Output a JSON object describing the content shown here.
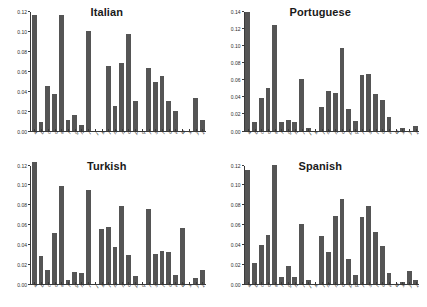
{
  "figure": {
    "layout": "2x2-grid",
    "bar_color": "#555555",
    "axis_color": "#3a3a3a",
    "background": "#ffffff"
  },
  "chart_data": [
    {
      "type": "bar",
      "title": "Italian",
      "xlabel": "",
      "ylabel": "",
      "ylim": [
        0.0,
        0.12
      ],
      "yticks": [
        "0.00",
        "0.02",
        "0.04",
        "0.06",
        "0.08",
        "0.10",
        "0.12"
      ],
      "ytick_values": [
        0.0,
        0.02,
        0.04,
        0.06,
        0.08,
        0.1,
        0.12
      ],
      "grid": false,
      "legend": "none",
      "categories": [
        "a",
        "b",
        "c",
        "d",
        "e",
        "f",
        "g",
        "h",
        "i",
        "j",
        "k",
        "l",
        "m",
        "n",
        "o",
        "p",
        "q",
        "r",
        "s",
        "t",
        "u",
        "v",
        "w",
        "x",
        "y",
        "z"
      ],
      "values": [
        0.117,
        0.009,
        0.045,
        0.037,
        0.117,
        0.011,
        0.016,
        0.006,
        0.101,
        0.0,
        0.0,
        0.065,
        0.025,
        0.068,
        0.098,
        0.03,
        0.0,
        0.063,
        0.049,
        0.055,
        0.03,
        0.02,
        0.0,
        0.0,
        0.033,
        0.011
      ]
    },
    {
      "type": "bar",
      "title": "Portuguese",
      "xlabel": "",
      "ylabel": "",
      "ylim": [
        0.0,
        0.14
      ],
      "yticks": [
        "0.00",
        "0.02",
        "0.04",
        "0.06",
        "0.08",
        "0.10",
        "0.12",
        "0.14"
      ],
      "ytick_values": [
        0.0,
        0.02,
        0.04,
        0.06,
        0.08,
        0.1,
        0.12,
        0.14
      ],
      "grid": false,
      "legend": "none",
      "categories": [
        "a",
        "b",
        "c",
        "d",
        "e",
        "f",
        "g",
        "h",
        "i",
        "j",
        "k",
        "l",
        "m",
        "n",
        "o",
        "p",
        "q",
        "r",
        "s",
        "t",
        "u",
        "v",
        "w",
        "x",
        "y",
        "z"
      ],
      "values": [
        0.14,
        0.01,
        0.039,
        0.05,
        0.125,
        0.01,
        0.012,
        0.01,
        0.061,
        0.003,
        0.0,
        0.028,
        0.047,
        0.044,
        0.098,
        0.025,
        0.011,
        0.065,
        0.067,
        0.043,
        0.036,
        0.016,
        0.0,
        0.003,
        0.0,
        0.005
      ]
    },
    {
      "type": "bar",
      "title": "Turkish",
      "xlabel": "",
      "ylabel": "",
      "ylim": [
        0.0,
        0.12
      ],
      "yticks": [
        "0.00",
        "0.02",
        "0.04",
        "0.06",
        "0.08",
        "0.10",
        "0.12"
      ],
      "ytick_values": [
        0.0,
        0.02,
        0.04,
        0.06,
        0.08,
        0.1,
        0.12
      ],
      "grid": false,
      "legend": "none",
      "categories": [
        "a",
        "b",
        "c",
        "d",
        "e",
        "f",
        "g",
        "h",
        "i",
        "j",
        "k",
        "l",
        "m",
        "n",
        "o",
        "p",
        "q",
        "r",
        "s",
        "t",
        "u",
        "v",
        "w",
        "x",
        "y",
        "z"
      ],
      "values": [
        0.124,
        0.028,
        0.014,
        0.052,
        0.099,
        0.004,
        0.012,
        0.011,
        0.095,
        0.0,
        0.056,
        0.058,
        0.037,
        0.079,
        0.029,
        0.008,
        0.0,
        0.076,
        0.03,
        0.033,
        0.032,
        0.009,
        0.057,
        0.0,
        0.006,
        0.014
      ]
    },
    {
      "type": "bar",
      "title": "Spanish",
      "xlabel": "",
      "ylabel": "",
      "ylim": [
        0.0,
        0.12
      ],
      "yticks": [
        "0.00",
        "0.02",
        "0.04",
        "0.06",
        "0.08",
        "0.10",
        "0.12"
      ],
      "ytick_values": [
        0.0,
        0.02,
        0.04,
        0.06,
        0.08,
        0.1,
        0.12
      ],
      "grid": false,
      "legend": "none",
      "categories": [
        "a",
        "b",
        "c",
        "d",
        "e",
        "f",
        "g",
        "h",
        "i",
        "j",
        "k",
        "l",
        "m",
        "n",
        "o",
        "p",
        "q",
        "r",
        "s",
        "t",
        "u",
        "v",
        "w",
        "x",
        "y",
        "z"
      ],
      "values": [
        0.115,
        0.021,
        0.04,
        0.05,
        0.121,
        0.007,
        0.018,
        0.007,
        0.061,
        0.004,
        0.0,
        0.049,
        0.032,
        0.069,
        0.086,
        0.025,
        0.009,
        0.068,
        0.079,
        0.053,
        0.039,
        0.011,
        0.0,
        0.002,
        0.013,
        0.004
      ]
    }
  ]
}
